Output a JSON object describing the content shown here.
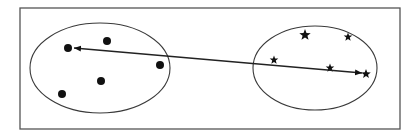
{
  "diagram": {
    "colors": {
      "stroke": "#3a3a3a",
      "fill": "#111111",
      "frame": "#555555",
      "background": "#ffffff"
    },
    "frame": {
      "x": 20,
      "y": 8,
      "width": 380,
      "height": 121
    },
    "clusters": [
      {
        "name": "cluster-left",
        "marker": "dot",
        "ellipse": {
          "cx": 100,
          "cy": 68,
          "rx": 70,
          "ry": 45
        },
        "points": [
          {
            "x": 68,
            "y": 48,
            "r": 4
          },
          {
            "x": 107,
            "y": 41,
            "r": 4
          },
          {
            "x": 160,
            "y": 65,
            "r": 4
          },
          {
            "x": 101,
            "y": 81,
            "r": 4
          },
          {
            "x": 62,
            "y": 94,
            "r": 4
          }
        ]
      },
      {
        "name": "cluster-right",
        "marker": "star",
        "ellipse": {
          "cx": 315,
          "cy": 68,
          "rx": 62,
          "ry": 42
        },
        "points": [
          {
            "x": 305,
            "y": 35,
            "r": 6
          },
          {
            "x": 348,
            "y": 37,
            "r": 4.5
          },
          {
            "x": 274,
            "y": 60,
            "r": 4.5
          },
          {
            "x": 330,
            "y": 68,
            "r": 4.5
          },
          {
            "x": 366,
            "y": 74,
            "r": 5
          }
        ]
      }
    ],
    "arrow": {
      "x1": 74,
      "y1": 48,
      "x2": 362,
      "y2": 73,
      "double_headed": true
    }
  }
}
